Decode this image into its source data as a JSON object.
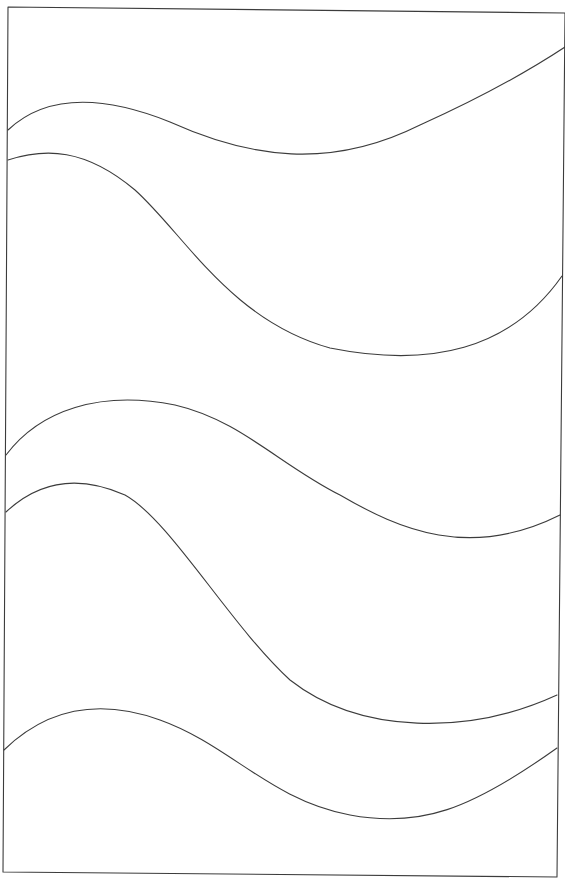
{
  "drawing": {
    "description": "Line drawing: skewed rectangular frame containing six wavy horizontal curves",
    "stroke_color": "#3c3c3c",
    "background_color": "#ffffff",
    "frame": {
      "points": "8,7 565,13 557,877 3,872"
    },
    "curves": [
      {
        "id": "wave-1",
        "d": "M8,130 C40,100 90,90 170,122 C250,158 330,170 420,125 C480,98 530,70 565,47"
      },
      {
        "id": "wave-2",
        "d": "M8,160 C45,148 85,148 135,190 C185,235 230,320 330,348 C430,368 510,350 562,276"
      },
      {
        "id": "wave-3",
        "d": "M6,455 C40,410 100,390 175,405 C240,420 280,465 340,495 C400,530 470,560 560,515"
      },
      {
        "id": "wave-4",
        "d": "M6,512 C40,480 80,475 125,495 C170,520 230,625 290,680 C360,735 470,735 557,695"
      },
      {
        "id": "wave-5",
        "d": "M4,750 C40,715 90,695 160,720 C230,745 270,800 350,815 C420,828 470,810 557,748"
      },
      {
        "id": "wave-6",
        "d": ""
      }
    ]
  }
}
